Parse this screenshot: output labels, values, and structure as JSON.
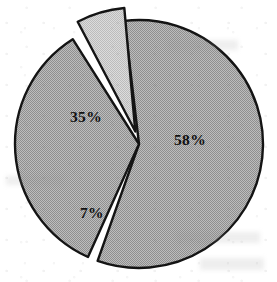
{
  "chart_data": {
    "type": "pie",
    "title": "",
    "subtitle": "",
    "xlabel": "",
    "ylabel": "",
    "legend_position": "none",
    "grid": false,
    "labels_shown_on_slices": true,
    "categories": [
      "58%",
      "35%",
      "7%"
    ],
    "values": [
      58,
      35,
      7
    ],
    "total": 100,
    "units": "percent",
    "slices": [
      {
        "label": "58%",
        "value": 58,
        "start_angle_deg": 352,
        "sweep_deg": 208.8,
        "fill_color": "#ababab",
        "stroke_color": "#141414",
        "exploded": false,
        "explode_offset_px": 0,
        "label_x": 190,
        "label_y": 145
      },
      {
        "label": "35%",
        "value": 35,
        "start_angle_deg": 203,
        "sweep_deg": 126.0,
        "fill_color": "#ababab",
        "stroke_color": "#141414",
        "exploded": false,
        "explode_offset_px": 0,
        "label_x": 86,
        "label_y": 122
      },
      {
        "label": "7%",
        "value": 7,
        "start_angle_deg": 331,
        "sweep_deg": 25.2,
        "fill_color": "#cccccc",
        "stroke_color": "#141414",
        "exploded": true,
        "explode_offset_px": 13,
        "label_x": 92,
        "label_y": 218
      }
    ],
    "geometry": {
      "center_x": 139,
      "center_y": 144,
      "radius": 124,
      "gap_deg": 2.6
    },
    "background_color": "#ffffff"
  }
}
